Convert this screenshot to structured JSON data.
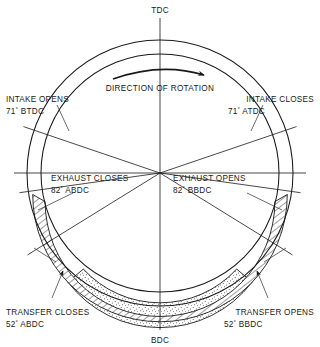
{
  "diagram": {
    "center_label_top": "TDC",
    "center_label_bottom": "BDC",
    "rotation_caption": "DIRECTION OF ROTATION",
    "rotation_sense": "clockwise",
    "geometry": {
      "cx": 160,
      "cy": 173,
      "r_outer": 133,
      "r_inner": 119,
      "r_band_outer": 116,
      "r_band_mid": 104,
      "r_band_inner": 93
    },
    "colors": {
      "line": "#1a1a1a",
      "background": "#ffffff",
      "hatch": "#1a1a1a",
      "stipple": "#4a4a4a"
    },
    "events": [
      {
        "id": "intake-opens",
        "name": "INTAKE OPENS",
        "angle_text": "71",
        "degree_symbol": "°",
        "reference": "BTDC",
        "angle_deg": 71,
        "side": "left"
      },
      {
        "id": "intake-closes",
        "name": "INTAKE CLOSES",
        "angle_text": "71",
        "degree_symbol": "°",
        "reference": "ATDC",
        "angle_deg": 71,
        "side": "right"
      },
      {
        "id": "exhaust-closes",
        "name": "EXHAUST CLOSES",
        "angle_text": "82",
        "degree_symbol": "°",
        "reference": "ABDC",
        "angle_deg": 82,
        "side": "left"
      },
      {
        "id": "exhaust-opens",
        "name": "EXHAUST OPENS",
        "angle_text": "82",
        "degree_symbol": "°",
        "reference": "BBDC",
        "angle_deg": 82,
        "side": "right"
      },
      {
        "id": "transfer-closes",
        "name": "TRANSFER CLOSES",
        "angle_text": "52",
        "degree_symbol": "°",
        "reference": "ABDC",
        "angle_deg": 52,
        "side": "left"
      },
      {
        "id": "transfer-opens",
        "name": "TRANSFER OPENS",
        "angle_text": "52",
        "degree_symbol": "°",
        "reference": "BBDC",
        "angle_deg": 52,
        "side": "right"
      }
    ]
  }
}
